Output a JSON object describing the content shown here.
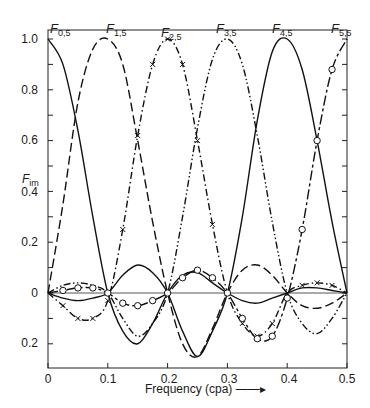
{
  "chart_data": {
    "type": "line",
    "title": "",
    "xlabel": "Frequency (cpa)",
    "ylabel": "F_im",
    "xlim": [
      0,
      0.5
    ],
    "ylim": [
      -0.3,
      1.05
    ],
    "x_ticks": [
      "0",
      "0.1",
      "0.2",
      "0.3",
      "0.4",
      "0.5"
    ],
    "y_ticks": [
      "1.0",
      "0.8",
      "0.6",
      "0.4",
      "0.2",
      "0",
      "0.2"
    ],
    "grid": false,
    "zero_line": true,
    "legend": "curve labels at top",
    "x": [
      0,
      0.025,
      0.05,
      0.075,
      0.1,
      0.125,
      0.15,
      0.175,
      0.2,
      0.225,
      0.25,
      0.275,
      0.3,
      0.325,
      0.35,
      0.375,
      0.4,
      0.425,
      0.45,
      0.475,
      0.5
    ],
    "series": [
      {
        "name": "F0,5",
        "label_main": "F",
        "label_sub": "0,5",
        "style": "solid",
        "marker": "none",
        "values": [
          1.0,
          0.9,
          0.64,
          0.3,
          0.0,
          -0.15,
          -0.2,
          -0.12,
          0.0,
          0.07,
          0.08,
          0.04,
          0.0,
          -0.03,
          -0.04,
          -0.02,
          0.0,
          0.02,
          0.02,
          0.01,
          0.0
        ]
      },
      {
        "name": "F1,5",
        "label_main": "F",
        "label_sub": "1,5",
        "style": "long-dash",
        "marker": "none",
        "values": [
          0.0,
          0.35,
          0.75,
          0.96,
          1.0,
          0.9,
          0.6,
          0.28,
          0.0,
          -0.2,
          -0.25,
          -0.14,
          0.0,
          0.09,
          0.11,
          0.07,
          0.0,
          -0.05,
          -0.06,
          -0.04,
          0.0
        ]
      },
      {
        "name": "F2,5",
        "label_main": "F",
        "label_sub": "2,5",
        "style": "dash-dot",
        "marker": "x",
        "values": [
          0.0,
          -0.05,
          -0.1,
          -0.1,
          -0.03,
          0.25,
          0.62,
          0.9,
          1.0,
          0.9,
          0.6,
          0.27,
          0.0,
          -0.12,
          -0.17,
          -0.12,
          0.0,
          0.03,
          0.04,
          0.03,
          0.0
        ]
      },
      {
        "name": "F3,5",
        "label_main": "F",
        "label_sub": "3,5",
        "style": "dash-dot-dot",
        "marker": "none",
        "values": [
          0.0,
          0.03,
          0.04,
          0.03,
          0.0,
          -0.1,
          -0.17,
          -0.12,
          0.0,
          0.3,
          0.65,
          0.92,
          1.0,
          0.9,
          0.62,
          0.28,
          0.0,
          -0.12,
          -0.16,
          -0.1,
          0.0
        ]
      },
      {
        "name": "F4,5",
        "label_main": "F",
        "label_sub": "4,5",
        "style": "solid",
        "marker": "none",
        "values": [
          0.0,
          -0.02,
          -0.03,
          -0.02,
          0.0,
          0.07,
          0.11,
          0.08,
          0.0,
          -0.15,
          -0.25,
          -0.15,
          0.0,
          0.3,
          0.68,
          0.95,
          1.0,
          0.88,
          0.6,
          0.28,
          0.0
        ]
      },
      {
        "name": "F5,5",
        "label_main": "F",
        "label_sub": "5,5",
        "style": "long-dash-short",
        "marker": "circle",
        "values": [
          0.0,
          0.01,
          0.02,
          0.02,
          0.0,
          -0.04,
          -0.05,
          -0.03,
          0.0,
          0.06,
          0.09,
          0.06,
          0.0,
          -0.1,
          -0.18,
          -0.17,
          -0.02,
          0.25,
          0.6,
          0.88,
          1.0
        ]
      }
    ]
  },
  "labels": {
    "x_axis_title": "Frequency (cpa) ——▸",
    "y_axis_main": "F",
    "y_axis_sub": "im",
    "curve_main": "F",
    "curve_subs": [
      "0,5",
      "1,5",
      "2,5",
      "3,5",
      "4,5",
      "5,5"
    ],
    "x_ticks": [
      "0",
      "0.1",
      "0.2",
      "0.3",
      "0.4",
      "0.5"
    ],
    "y_ticks": [
      "1.0",
      "0.8",
      "0.6",
      "0.4",
      "0.2",
      "0",
      "0.2"
    ]
  }
}
